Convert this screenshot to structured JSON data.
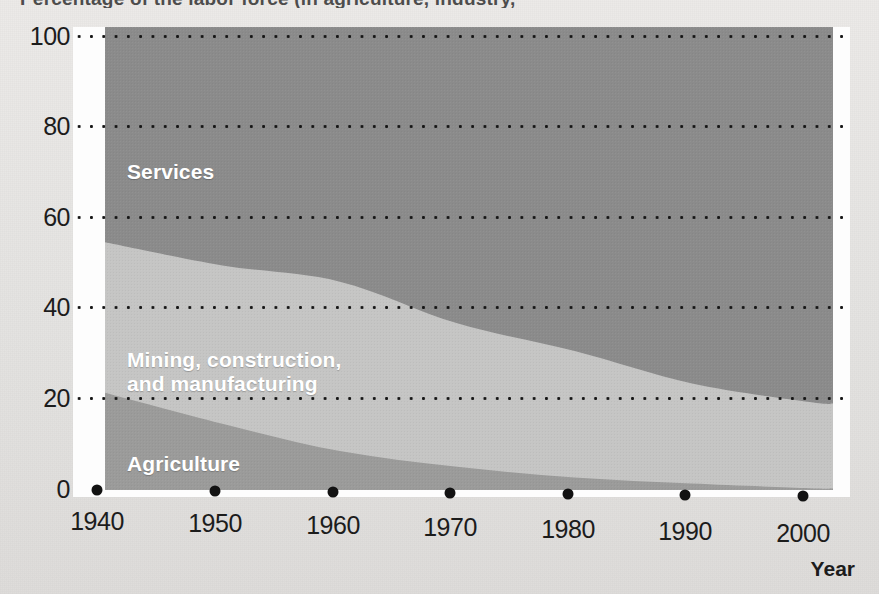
{
  "figure": {
    "title_fragment": "Percentage of the labor force (in agriculture, industry,",
    "axis": {
      "x_title": "Year",
      "y_ticks": [
        "0",
        "20",
        "40",
        "60",
        "80",
        "100"
      ],
      "x_ticks": [
        "1940",
        "1950",
        "1960",
        "1970",
        "1980",
        "1990",
        "2000"
      ]
    },
    "series_labels": {
      "services": "Services",
      "mining": "Mining, construction,\nand manufacturing",
      "agriculture": "Agriculture"
    },
    "colors": {
      "services": "#8b8b8b",
      "mining": "#c5c5c4",
      "agriculture": "#9b9b9a",
      "plot_background": "#fdfdfd",
      "page_background": "#e6e5e3",
      "gridline": "#151515",
      "tick_dot": "#121212",
      "label_text": "#ffffff",
      "axis_text": "#1c1c1c"
    }
  },
  "chart_data": {
    "type": "area",
    "title": "Percentage of the labor force (in agriculture, industry,",
    "xlabel": "Year",
    "ylabel": "",
    "xlim": [
      1940,
      2002
    ],
    "ylim": [
      0,
      100
    ],
    "grid": true,
    "legend": "inline-labels",
    "stacked": true,
    "x": [
      1940,
      1950,
      1960,
      1970,
      1980,
      1990,
      2000,
      2002
    ],
    "series": [
      {
        "name": "Agriculture",
        "color": "#9b9b9a",
        "values": [
          21.0,
          14.3,
          8.4,
          5.0,
          2.7,
          1.4,
          0.4,
          0.3
        ]
      },
      {
        "name": "Mining, construction, and manufacturing",
        "color": "#c5c5c4",
        "values": [
          32.5,
          34.2,
          36.6,
          31.0,
          27.3,
          21.6,
          18.6,
          18.4
        ]
      },
      {
        "name": "Services",
        "color": "#8b8b8b",
        "values": [
          46.5,
          51.5,
          55.0,
          64.0,
          70.0,
          77.0,
          81.0,
          81.3
        ]
      }
    ],
    "cumulative_upper_bounds": {
      "agriculture": [
        21.0,
        14.3,
        8.4,
        5.0,
        2.7,
        1.4,
        0.4,
        0.3
      ],
      "agriculture_plus_mining": [
        53.5,
        48.5,
        45.0,
        36.0,
        30.0,
        23.0,
        19.0,
        18.7
      ],
      "total": [
        100,
        100,
        100,
        100,
        100,
        100,
        100,
        100
      ]
    }
  }
}
